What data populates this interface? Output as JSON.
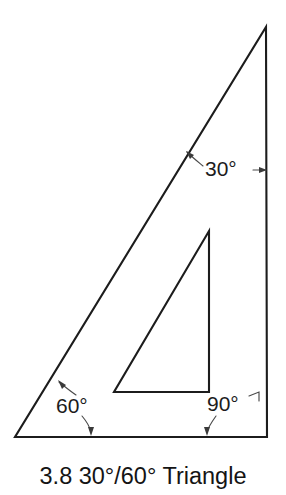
{
  "figure": {
    "caption": "3.8 30°/60° Triangle",
    "title": "30°/60° Triangle",
    "figure_number": "3.8",
    "background_color": "#ffffff",
    "line_color": "#1c1c1c",
    "leader_color": "#4a4a4a"
  },
  "angles": {
    "top": {
      "label": "30°",
      "value": 30,
      "unit": "degrees",
      "position": "top-right-apex"
    },
    "left": {
      "label": "60°",
      "value": 60,
      "unit": "degrees",
      "position": "bottom-left-vertex"
    },
    "right": {
      "label": "90°",
      "value": 90,
      "unit": "degrees",
      "position": "bottom-right-vertex"
    }
  },
  "geometry": {
    "outer_triangle": {
      "name": "30-60-90 drafting triangle outline",
      "apex": [
        266,
        27
      ],
      "bottom_left": [
        15,
        437
      ],
      "bottom_right": [
        267,
        437
      ]
    },
    "inner_cutout": {
      "name": "interior triangular cutout",
      "apex": [
        209,
        231
      ],
      "bottom_left": [
        114,
        392
      ],
      "bottom_right": [
        209,
        392
      ]
    }
  }
}
